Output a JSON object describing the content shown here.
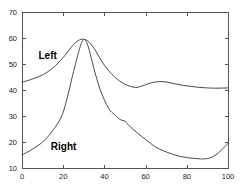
{
  "chart_data": {
    "type": "line",
    "title": "",
    "xlabel": "",
    "ylabel": "",
    "xlim": [
      0,
      100
    ],
    "ylim": [
      10,
      70
    ],
    "grid": false,
    "legend_position": "inline-annotation",
    "xticks": [
      0,
      20,
      40,
      60,
      80,
      100
    ],
    "yticks": [
      10,
      20,
      30,
      40,
      50,
      60,
      70
    ],
    "xtick_labels": [
      "0",
      "20",
      "40",
      "60",
      "80",
      "100"
    ],
    "ytick_labels": [
      "10",
      "20",
      "30",
      "40",
      "50",
      "60",
      "70"
    ],
    "annotations": [
      {
        "text": "Left",
        "x": 8,
        "y": 52
      },
      {
        "text": "Right",
        "x": 14,
        "y": 17
      }
    ],
    "series": [
      {
        "name": "Left",
        "color": "#4a4a4a",
        "x": [
          0,
          5,
          10,
          15,
          20,
          25,
          28,
          30,
          32,
          35,
          40,
          45,
          50,
          55,
          58,
          62,
          66,
          70,
          74,
          78,
          82,
          86,
          90,
          94,
          100
        ],
        "values": [
          43.0,
          44.2,
          45.8,
          48.5,
          52.5,
          57.5,
          59.3,
          59.5,
          58.8,
          56.0,
          49.5,
          45.0,
          42.2,
          41.0,
          41.5,
          42.6,
          43.2,
          43.1,
          42.4,
          41.8,
          41.4,
          41.0,
          40.8,
          40.7,
          40.8
        ]
      },
      {
        "name": "Right",
        "color": "#4a4a4a",
        "x": [
          0,
          5,
          10,
          15,
          20,
          25,
          28,
          30,
          32,
          35,
          38,
          42,
          45,
          48,
          50,
          53,
          56,
          60,
          65,
          70,
          75,
          80,
          85,
          88,
          91,
          94,
          97,
          100
        ],
        "values": [
          15.0,
          17.2,
          20.0,
          24.5,
          31.5,
          47.0,
          56.0,
          59.4,
          57.0,
          48.0,
          40.0,
          33.0,
          30.5,
          28.5,
          28.0,
          25.5,
          23.5,
          21.0,
          18.0,
          16.2,
          14.8,
          14.0,
          13.6,
          13.5,
          13.8,
          15.0,
          17.0,
          19.5
        ]
      }
    ]
  },
  "plot_geometry": {
    "left": 22,
    "right": 228,
    "top": 12,
    "bottom": 168
  }
}
